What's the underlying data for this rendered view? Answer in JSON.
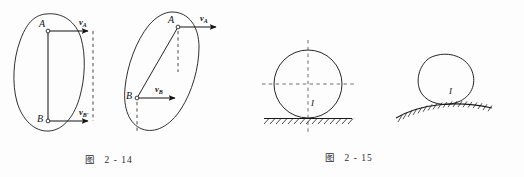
{
  "page": {
    "background_color": "#fdfdfd",
    "ink_color": "#1a1a1a",
    "width": 524,
    "height": 177
  },
  "figures": [
    {
      "id": "fig-2-14",
      "caption_prefix": "图",
      "caption_number": "2 - 14",
      "description": "Two rigid body outlines showing velocities of points A and B",
      "panels": [
        {
          "id": "left-panel",
          "shape": "blob-outline",
          "points": [
            {
              "name": "A",
              "label": "A",
              "marker": "open-circle"
            },
            {
              "name": "B",
              "label": "B",
              "marker": "open-circle"
            }
          ],
          "vectors": [
            {
              "name": "vA",
              "symbol": "v",
              "subscript": "A",
              "direction": "right"
            },
            {
              "name": "vBprime",
              "symbol": "v",
              "subscript": "B'",
              "direction": "right"
            }
          ],
          "connector": "solid-segment-AB",
          "dashed_guide": "vertical-projection-line"
        },
        {
          "id": "right-panel",
          "shape": "tilted-ellipse-outline",
          "points": [
            {
              "name": "A",
              "label": "A",
              "marker": "open-circle"
            },
            {
              "name": "B",
              "label": "B",
              "marker": "open-circle"
            }
          ],
          "vectors": [
            {
              "name": "vA",
              "symbol": "v",
              "subscript": "A",
              "direction": "right"
            },
            {
              "name": "vB",
              "symbol": "v",
              "subscript": "B",
              "direction": "right"
            }
          ],
          "connector": "solid-segment-AB",
          "dashed_guides": [
            "dashed-drop-from-A",
            "dashed-drop-from-B"
          ]
        }
      ]
    },
    {
      "id": "fig-2-15",
      "caption_prefix": "图",
      "caption_number": "2 - 15",
      "description": "Circle on flat hatched ground and oval on curved hatched ground, contact point labelled I",
      "panels": [
        {
          "id": "circle-panel",
          "shape": "circle",
          "ground": "flat-hatched-line",
          "guides": [
            "dashed-vertical-axis",
            "dashed-horizontal-axis"
          ],
          "labels": [
            {
              "name": "contact-point",
              "text": "I"
            }
          ]
        },
        {
          "id": "oval-panel",
          "shape": "egg-oval",
          "ground": "curved-hatched-line",
          "labels": [
            {
              "name": "contact-point",
              "text": "I"
            }
          ]
        }
      ]
    }
  ],
  "labels": {
    "fig214_left_A": "A",
    "fig214_left_B": "B",
    "fig214_left_vA": "v",
    "fig214_left_vA_sub": "A",
    "fig214_left_vB": "v",
    "fig214_left_vB_sub": "B'",
    "fig214_right_A": "A",
    "fig214_right_B": "B",
    "fig214_right_vA": "v",
    "fig214_right_vA_sub": "A",
    "fig214_right_vB": "v",
    "fig214_right_vB_sub": "B",
    "fig215_circle_I": "I",
    "fig215_oval_I": "I"
  }
}
